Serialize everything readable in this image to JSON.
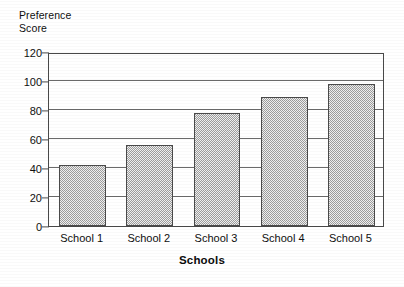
{
  "chart_data": {
    "type": "bar",
    "title": "",
    "subtitle": "",
    "ylabel": "Preference\nScore",
    "xlabel": "Schools",
    "categories": [
      "School 1",
      "School 2",
      "School 3",
      "School 4",
      "School 5"
    ],
    "values": [
      42,
      56,
      78,
      89,
      98
    ],
    "ylim": [
      0,
      120
    ],
    "ytick_step": 20,
    "ytick_labels": [
      "0",
      "20",
      "40",
      "60",
      "80",
      "100",
      "120"
    ],
    "ytick_values": [
      0,
      20,
      40,
      60,
      80,
      100,
      120
    ],
    "grid": true,
    "grid_axis": "y",
    "legend": false,
    "legend_position": "none",
    "annotations": [],
    "series": [
      {
        "name": "Preference Score",
        "values": [
          42,
          56,
          78,
          89,
          98
        ],
        "fill": "#9d9d9d",
        "fill_pattern": "checkerboard-dither",
        "edge_color": "#4a4a4a"
      }
    ],
    "colors": {
      "bar_fill": "#9d9d9d",
      "bar_edge": "#4a4a4a",
      "gridline": "#6a6a6a",
      "axis": "#494949",
      "text": "#0f0f0f",
      "background": "#ffffff"
    }
  }
}
